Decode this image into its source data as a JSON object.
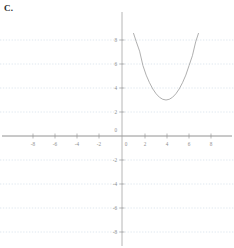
{
  "figure": {
    "part_label": "C."
  },
  "chart_data": {
    "type": "line",
    "title": "",
    "subtitle": "",
    "xlabel": "",
    "ylabel": "",
    "xlim": [
      -9.5,
      9.5
    ],
    "ylim": [
      -9.2,
      9.6
    ],
    "grid": true,
    "legend_position": "none",
    "annotations": [],
    "x_ticks": [
      -8,
      -6,
      -4,
      -2,
      0,
      2,
      4,
      6,
      8
    ],
    "x_tick_labels": [
      "-8",
      "-6",
      "-4",
      "-2",
      "0",
      "2",
      "4",
      "6",
      "8"
    ],
    "y_ticks": [
      8,
      6,
      4,
      2,
      0,
      -2,
      -4,
      -6,
      -8
    ],
    "y_tick_labels": [
      "8",
      "6",
      "4",
      "2",
      "0",
      "-2",
      "-4",
      "-6",
      "-8"
    ],
    "curve_color": "#9a9a9a",
    "axis_color": "#6f6f6f",
    "grid_color": "#c9d6e4",
    "series": [
      {
        "name": "parabola",
        "equation": "y = 0.64(x - 4)^2 + 3",
        "vertex": [
          4,
          3
        ],
        "x": [
          1.05,
          1.3,
          1.6,
          1.9,
          2.2,
          2.5,
          2.8,
          3.1,
          3.4,
          3.7,
          4.0,
          4.3,
          4.6,
          4.9,
          5.2,
          5.5,
          5.8,
          6.1,
          6.4,
          6.7,
          6.95
        ],
        "values": [
          8.55,
          7.85,
          7.07,
          5.88,
          5.07,
          4.44,
          3.92,
          3.52,
          3.23,
          3.06,
          3.0,
          3.06,
          3.23,
          3.52,
          3.92,
          4.44,
          5.07,
          5.88,
          6.69,
          7.85,
          8.55
        ]
      }
    ]
  }
}
